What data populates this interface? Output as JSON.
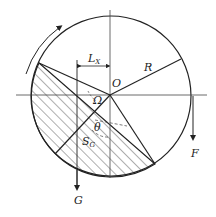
{
  "diagram": {
    "type": "mechanics-diagram",
    "labels": {
      "center": "O",
      "radius": "R",
      "offset": "L",
      "offset_sub": "X",
      "angle_omega": "Ω",
      "angle_theta": "θ",
      "centroid": "S",
      "centroid_sub": "G",
      "gravity": "G",
      "force": "F"
    },
    "rotation_direction": "clockwise",
    "colors": {
      "line": "#222222",
      "hatch": "#333333",
      "background": "#ffffff"
    }
  }
}
